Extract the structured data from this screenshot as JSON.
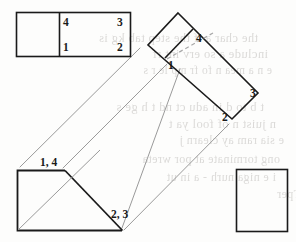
{
  "figure": {
    "background_color": "#fdfdfc",
    "ink_color": "#1a1a1a",
    "projection_line_color": "#9a9a9a",
    "dashed_line_color": "#a8a8a8",
    "views": {
      "top_view": {
        "name": "top-view",
        "labels": {
          "corner_4": "4",
          "corner_3": "3",
          "corner_1": "1",
          "corner_2": "2"
        }
      },
      "rotated_view": {
        "name": "rotated-view",
        "rotation_degrees": 45,
        "labels": {
          "corner_4": "4",
          "corner_1": "1",
          "corner_3": "3",
          "corner_2": "2"
        }
      },
      "front_view": {
        "name": "front-view",
        "labels": {
          "corner_1_4": "1, 4",
          "corner_2_3": "2, 3"
        }
      },
      "side_view": {
        "name": "side-view",
        "labels": {}
      }
    },
    "bleed_through_text": [
      {
        "text": "the char   a   if the step    tab  kg    is",
        "x": 8,
        "y": 31,
        "size": 12.5
      },
      {
        "text": "include   a    so   erv   int    rf",
        "x": 18,
        "y": 47,
        "size": 12.5
      },
      {
        "text": "e   n   a   mea   n   fo    fr   mp   le   r   s",
        "x": 22,
        "y": 64,
        "size": 11.5
      },
      {
        "text": "t b   to   d  in  adu   ct nd  t  h  ge   s",
        "x": 14,
        "y": 100,
        "size": 12.5
      },
      {
        "text": "n   juist  n  of   fool  ya  t",
        "x": 26,
        "y": 117,
        "size": 12.5
      },
      {
        "text": "e   sia    ram   ay  clearn  j",
        "x": 34,
        "y": 133,
        "size": 12.0
      },
      {
        "text": "ong   torminate  at  por  wreta",
        "x": 30,
        "y": 152,
        "size": 12.0
      },
      {
        "text": "i  e   niga   nurh - a  in  ut",
        "x": 26,
        "y": 170,
        "size": 12.0
      },
      {
        "text": "e   Tper",
        "x": 60,
        "y": 187,
        "size": 12.0
      }
    ]
  }
}
